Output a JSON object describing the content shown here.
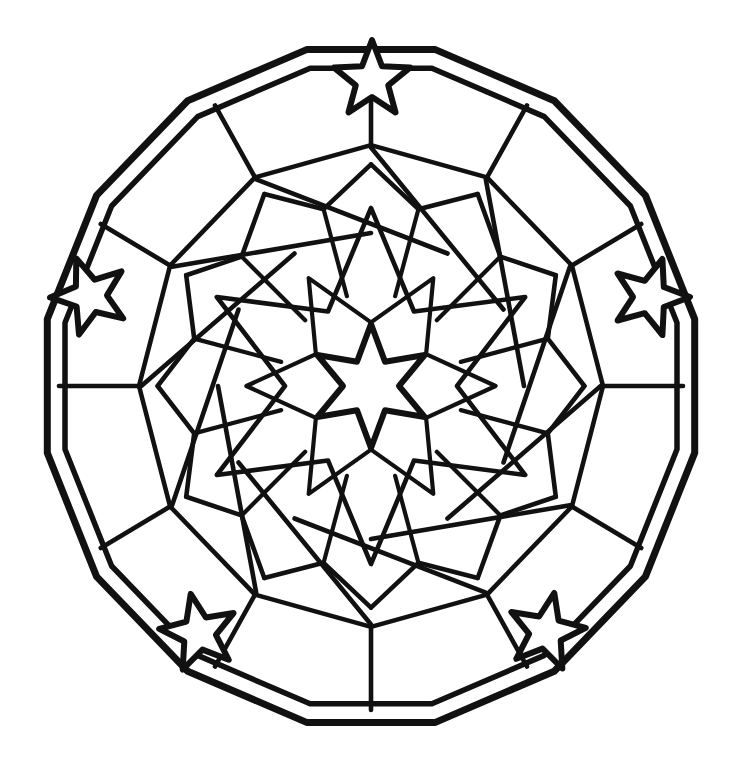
{
  "artwork": {
    "title": "Star Kaleidoscope Mandala Coloring Page",
    "type": "line-art-coloring-page",
    "canvas": {
      "width": 742,
      "height": 783
    },
    "palette": {
      "background": "#ffffff",
      "ink": "#111111",
      "fill": "#ffffff"
    },
    "symmetry": {
      "order": 6,
      "mirror": true,
      "center": [
        371,
        386
      ]
    },
    "geometry": {
      "ring_outer": {
        "label": "outer polygon rim",
        "sides": 16,
        "radius_x": 330,
        "radius_y": 343,
        "rotation_deg": 11.25
      },
      "ring_inner": {
        "label": "inner polygon rim",
        "sides": 16,
        "radius_x": 312,
        "radius_y": 324,
        "rotation_deg": 11.25
      },
      "center_star": {
        "label": "central six-point star",
        "points": 6,
        "outer_radius": 62,
        "inner_radius": 28,
        "rotation_deg": -90
      },
      "halo_star": {
        "label": "large six-point halo star",
        "points": 6,
        "outer_radius": 178,
        "inner_radius": 86,
        "rotation_deg": -90
      },
      "mid_ring_radius": 150,
      "outer_band_radius": 232,
      "accent_stars": {
        "label": "five-point rim stars",
        "count": 5,
        "points": 5,
        "outer_radius": 40,
        "inner_radius": 17,
        "placements": [
          {
            "name": "top",
            "cx": 372,
            "cy": 80,
            "rotation_deg": 0
          },
          {
            "name": "left",
            "cx": 90,
            "cy": 296,
            "rotation_deg": -20
          },
          {
            "name": "right",
            "cx": 650,
            "cy": 297,
            "rotation_deg": 18
          },
          {
            "name": "bottom-left",
            "cx": 199,
            "cy": 633,
            "rotation_deg": -12
          },
          {
            "name": "bottom-right",
            "cx": 546,
            "cy": 632,
            "rotation_deg": 12
          }
        ]
      }
    }
  },
  "chart_data": {
    "type": "scatter",
    "xlabel": "",
    "ylabel": "",
    "categories": [
      "outer rim",
      "inner rim",
      "outer facet band",
      "mid facet band",
      "halo star",
      "center star",
      "accent stars"
    ],
    "values": [
      16,
      16,
      12,
      12,
      6,
      6,
      5
    ],
    "annotations": [
      "Six-fold radial symmetry with mirror axis",
      "Black outline only, all regions left white for coloring"
    ]
  }
}
